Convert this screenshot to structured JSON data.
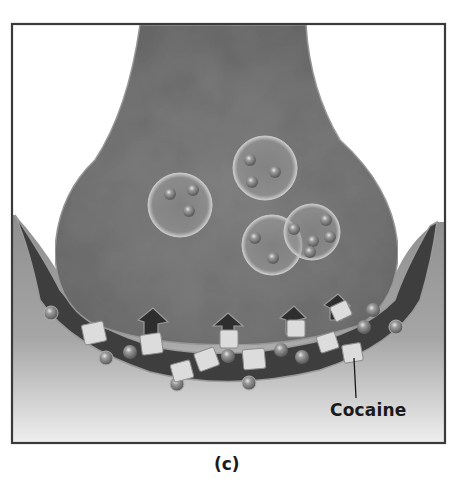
{
  "figure": {
    "panel_label": "(c)",
    "annotations": [
      {
        "id": "cocaine",
        "text": "Cocaine"
      }
    ],
    "elements": {
      "presynaptic_terminal": "axon-terminal",
      "vesicles": 4,
      "neurotransmitter_molecules": "spheres",
      "cocaine_molecules": "cubes",
      "reuptake_transporters": 4,
      "synaptic_cleft": "dark-band"
    },
    "colors": {
      "frame": "#3a3a3a",
      "terminal_fill": "#7c7c7c",
      "cleft_fill": "#3e3e3e",
      "postsynaptic_fill": "#b4b4b4",
      "cube_fill": "#dcdcdc",
      "sphere_fill": "#8d8d8d"
    }
  }
}
